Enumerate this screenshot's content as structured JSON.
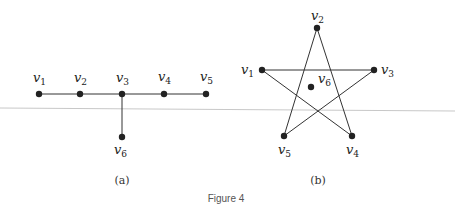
{
  "figure_title": "Figure 4",
  "graph_a": {
    "caption": "(a)",
    "nodes": [
      {
        "id": "v1",
        "name": "v",
        "sub": "1",
        "x": 39,
        "y": 94,
        "lx": 33,
        "ly": 82
      },
      {
        "id": "v2",
        "name": "v",
        "sub": "2",
        "x": 80,
        "y": 94,
        "lx": 74,
        "ly": 82
      },
      {
        "id": "v3",
        "name": "v",
        "sub": "3",
        "x": 122,
        "y": 94,
        "lx": 116,
        "ly": 82
      },
      {
        "id": "v4",
        "name": "v",
        "sub": "4",
        "x": 164,
        "y": 94,
        "lx": 158,
        "ly": 81
      },
      {
        "id": "v5",
        "name": "v",
        "sub": "5",
        "x": 206,
        "y": 94,
        "lx": 200,
        "ly": 81
      },
      {
        "id": "v6",
        "name": "v",
        "sub": "6",
        "x": 122,
        "y": 137,
        "lx": 114,
        "ly": 154
      }
    ],
    "edges": [
      [
        "v1",
        "v2"
      ],
      [
        "v2",
        "v3"
      ],
      [
        "v3",
        "v4"
      ],
      [
        "v4",
        "v5"
      ],
      [
        "v3",
        "v6"
      ]
    ]
  },
  "graph_b": {
    "caption": "(b)",
    "nodes": [
      {
        "id": "v1",
        "name": "v",
        "sub": "1",
        "x": 262,
        "y": 70,
        "lx": 241,
        "ly": 74
      },
      {
        "id": "v2",
        "name": "v",
        "sub": "2",
        "x": 317,
        "y": 28,
        "lx": 311,
        "ly": 20
      },
      {
        "id": "v3",
        "name": "v",
        "sub": "3",
        "x": 374,
        "y": 70,
        "lx": 381,
        "ly": 74
      },
      {
        "id": "v4",
        "name": "v",
        "sub": "4",
        "x": 352,
        "y": 136,
        "lx": 346,
        "ly": 154
      },
      {
        "id": "v5",
        "name": "v",
        "sub": "5",
        "x": 284,
        "y": 136,
        "lx": 278,
        "ly": 154
      },
      {
        "id": "v6",
        "name": "v",
        "sub": "6",
        "x": 311,
        "y": 87,
        "lx": 318,
        "ly": 83
      }
    ],
    "edges": [
      [
        "v1",
        "v3"
      ],
      [
        "v1",
        "v4"
      ],
      [
        "v2",
        "v4"
      ],
      [
        "v2",
        "v5"
      ],
      [
        "v3",
        "v5"
      ]
    ]
  },
  "divider": {
    "x1": 0,
    "y1": 108,
    "x2": 455,
    "y2": 111,
    "color": "#c8c8c8"
  }
}
